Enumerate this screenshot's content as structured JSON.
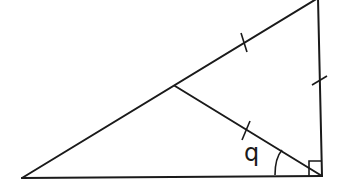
{
  "diagram": {
    "type": "right-triangle-with-median",
    "angle_label": "q",
    "stroke_color": "#1a1a1a",
    "background": "#ffffff",
    "vertices": {
      "left": [
        22,
        178
      ],
      "right_angle": [
        322,
        176
      ],
      "top": [
        318,
        -2
      ],
      "hyp_midpoint": [
        175,
        86
      ]
    },
    "equal_segments": [
      "hypotenuse-upper-half",
      "vertical-leg",
      "median"
    ],
    "right_angle_marker": true
  }
}
